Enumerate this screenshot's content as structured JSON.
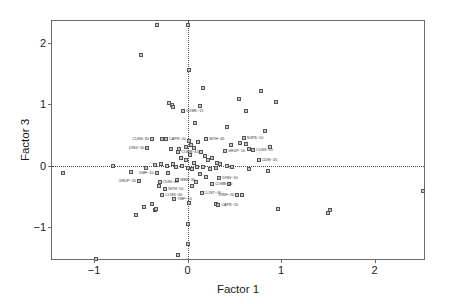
{
  "chart_data": {
    "type": "scatter",
    "title": "",
    "xlabel": "Factor 1",
    "ylabel": "Factor 3",
    "xlim": [
      -1.45,
      2.55
    ],
    "ylim": [
      -1.55,
      2.35
    ],
    "xticks": [
      -1,
      0,
      1,
      2
    ],
    "xticklabels": [
      "−1",
      "0",
      "1",
      "2"
    ],
    "yticks": [
      -1,
      0,
      1,
      2
    ],
    "yticklabels": [
      "−1",
      "0",
      "1",
      "2"
    ],
    "grid": false,
    "legend": null,
    "reference_lines": [
      {
        "axis": "x",
        "value": 0,
        "style": "dotted"
      },
      {
        "axis": "y",
        "value": 0,
        "style": "dotted"
      }
    ],
    "marker": {
      "shape": "square",
      "size": 4,
      "fill": "#c9c9c9",
      "edge": "#555555"
    },
    "points": [
      {
        "x": -0.5,
        "y": 1.8,
        "label": ""
      },
      {
        "x": 0.0,
        "y": 2.28,
        "label": ""
      },
      {
        "x": -0.33,
        "y": 2.28,
        "label": ""
      },
      {
        "x": 0.02,
        "y": 1.55,
        "label": ""
      },
      {
        "x": 0.17,
        "y": 1.26,
        "label": ""
      },
      {
        "x": -0.2,
        "y": 1.01,
        "label": ""
      },
      {
        "x": -0.17,
        "y": 0.98,
        "label": ""
      },
      {
        "x": -0.16,
        "y": 0.96,
        "label": ""
      },
      {
        "x": 0.13,
        "y": 0.97,
        "label": ""
      },
      {
        "x": -0.05,
        "y": 0.88,
        "label": "COMK~15"
      },
      {
        "x": 0.08,
        "y": 0.7,
        "label": ""
      },
      {
        "x": 0.55,
        "y": 1.08,
        "label": ""
      },
      {
        "x": 0.62,
        "y": 0.88,
        "label": ""
      },
      {
        "x": 0.42,
        "y": 0.62,
        "label": ""
      },
      {
        "x": 0.78,
        "y": 1.22,
        "label": ""
      },
      {
        "x": 0.95,
        "y": 1.03,
        "label": ""
      },
      {
        "x": -0.38,
        "y": 0.43,
        "label": "CUSS~30",
        "anchor": "left"
      },
      {
        "x": -0.27,
        "y": 0.44,
        "label": ""
      },
      {
        "x": -0.23,
        "y": 0.44,
        "label": "CAPR~20",
        "anchor": "right"
      },
      {
        "x": -0.43,
        "y": 0.29,
        "label": "DINV~30",
        "anchor": "left"
      },
      {
        "x": -0.18,
        "y": 0.27,
        "label": ""
      },
      {
        "x": -0.09,
        "y": 0.27,
        "label": ""
      },
      {
        "x": -0.1,
        "y": 0.22,
        "label": "COMB~40",
        "anchor": "right"
      },
      {
        "x": -0.02,
        "y": 0.3,
        "label": ""
      },
      {
        "x": 0.04,
        "y": 0.33,
        "label": ""
      },
      {
        "x": 0.07,
        "y": 0.29,
        "label": ""
      },
      {
        "x": 0.11,
        "y": 0.38,
        "label": ""
      },
      {
        "x": 0.02,
        "y": 0.4,
        "label": ""
      },
      {
        "x": 0.2,
        "y": 0.44,
        "label": "INTH~40",
        "anchor": "right"
      },
      {
        "x": 0.14,
        "y": 0.22,
        "label": ""
      },
      {
        "x": 0.19,
        "y": 0.16,
        "label": ""
      },
      {
        "x": 0.22,
        "y": 0.09,
        "label": ""
      },
      {
        "x": 0.26,
        "y": 0.13,
        "label": ""
      },
      {
        "x": 0.31,
        "y": 0.05,
        "label": ""
      },
      {
        "x": 0.6,
        "y": 0.45,
        "label": "SUPS~10",
        "anchor": "right"
      },
      {
        "x": 0.56,
        "y": 0.36,
        "label": ""
      },
      {
        "x": 0.63,
        "y": 0.35,
        "label": ""
      },
      {
        "x": 0.66,
        "y": 0.27,
        "label": ""
      },
      {
        "x": 0.7,
        "y": 0.26,
        "label": "CUSS~10",
        "anchor": "right"
      },
      {
        "x": 0.88,
        "y": 0.31,
        "label": ""
      },
      {
        "x": 0.4,
        "y": 0.24,
        "label": "GRUP~10",
        "anchor": "right"
      },
      {
        "x": 0.76,
        "y": 0.09,
        "label": "CDIN~20",
        "anchor": "right"
      },
      {
        "x": 0.35,
        "y": 0.02,
        "label": ""
      },
      {
        "x": 0.42,
        "y": 0.0,
        "label": ""
      },
      {
        "x": 0.48,
        "y": -0.02,
        "label": ""
      },
      {
        "x": 0.3,
        "y": -0.04,
        "label": ""
      },
      {
        "x": 0.24,
        "y": -0.06,
        "label": ""
      },
      {
        "x": 0.17,
        "y": -0.03,
        "label": ""
      },
      {
        "x": 0.1,
        "y": -0.02,
        "label": ""
      },
      {
        "x": 0.05,
        "y": -0.06,
        "label": ""
      },
      {
        "x": 0.0,
        "y": -0.04,
        "label": ""
      },
      {
        "x": -0.06,
        "y": -0.01,
        "label": ""
      },
      {
        "x": -0.12,
        "y": -0.03,
        "label": ""
      },
      {
        "x": -0.16,
        "y": 0.02,
        "label": ""
      },
      {
        "x": -0.22,
        "y": 0.0,
        "label": ""
      },
      {
        "x": -0.28,
        "y": 0.03,
        "label": ""
      },
      {
        "x": -0.35,
        "y": 0.01,
        "label": ""
      },
      {
        "x": -0.8,
        "y": 0.0,
        "label": ""
      },
      {
        "x": -1.33,
        "y": -0.12,
        "label": ""
      },
      {
        "x": -0.6,
        "y": -0.11,
        "label": ""
      },
      {
        "x": -0.33,
        "y": -0.12,
        "label": "DMF~10",
        "anchor": "left"
      },
      {
        "x": -0.21,
        "y": -0.12,
        "label": ""
      },
      {
        "x": -0.52,
        "y": -0.25,
        "label": "GRUP~20",
        "anchor": "left"
      },
      {
        "x": -0.3,
        "y": -0.26,
        "label": "CDIN~40",
        "anchor": "right"
      },
      {
        "x": -0.31,
        "y": -0.33,
        "label": ""
      },
      {
        "x": -0.11,
        "y": -0.24,
        "label": "WEB~30",
        "anchor": "right"
      },
      {
        "x": -0.24,
        "y": -0.38,
        "label": "INTH~10",
        "anchor": "right"
      },
      {
        "x": -0.27,
        "y": -0.47,
        "label": "COSK~40",
        "anchor": "right"
      },
      {
        "x": -0.14,
        "y": -0.55,
        "label": "YMF~10",
        "anchor": "right"
      },
      {
        "x": -0.38,
        "y": -0.62,
        "label": ""
      },
      {
        "x": -0.47,
        "y": -0.68,
        "label": ""
      },
      {
        "x": -0.55,
        "y": -0.8,
        "label": ""
      },
      {
        "x": -0.35,
        "y": -0.72,
        "label": ""
      },
      {
        "x": -0.34,
        "y": -0.7,
        "label": ""
      },
      {
        "x": 0.13,
        "y": -0.14,
        "label": ""
      },
      {
        "x": 0.2,
        "y": -0.18,
        "label": ""
      },
      {
        "x": 0.34,
        "y": -0.2,
        "label": "DINV~30",
        "anchor": "right"
      },
      {
        "x": 0.26,
        "y": -0.3,
        "label": "COMB~20",
        "anchor": "right"
      },
      {
        "x": 0.09,
        "y": -0.26,
        "label": ""
      },
      {
        "x": 0.05,
        "y": -0.33,
        "label": ""
      },
      {
        "x": 0.15,
        "y": -0.45,
        "label": "COST~30",
        "anchor": "right"
      },
      {
        "x": 0.44,
        "y": -0.3,
        "label": ""
      },
      {
        "x": 0.53,
        "y": -0.48,
        "label": "DINF~20",
        "anchor": "left"
      },
      {
        "x": 0.58,
        "y": -0.48,
        "label": ""
      },
      {
        "x": 0.3,
        "y": -0.62,
        "label": ""
      },
      {
        "x": 0.33,
        "y": -0.64,
        "label": "CAPR~10",
        "anchor": "right"
      },
      {
        "x": 0.02,
        "y": -0.6,
        "label": ""
      },
      {
        "x": 0.0,
        "y": -0.95,
        "label": ""
      },
      {
        "x": 0.0,
        "y": -1.28,
        "label": ""
      },
      {
        "x": -0.1,
        "y": -1.45,
        "label": ""
      },
      {
        "x": -0.98,
        "y": -1.52,
        "label": ""
      },
      {
        "x": 0.97,
        "y": -0.7,
        "label": ""
      },
      {
        "x": 1.52,
        "y": -0.72,
        "label": ""
      },
      {
        "x": 1.5,
        "y": -0.77,
        "label": ""
      },
      {
        "x": 2.52,
        "y": -0.42,
        "label": ""
      },
      {
        "x": 0.83,
        "y": 0.56,
        "label": ""
      },
      {
        "x": 0.46,
        "y": 0.33,
        "label": ""
      },
      {
        "x": -0.07,
        "y": 0.12,
        "label": ""
      },
      {
        "x": 0.03,
        "y": 0.17,
        "label": ""
      },
      {
        "x": -0.02,
        "y": 0.09,
        "label": ""
      },
      {
        "x": 0.07,
        "y": 0.05,
        "label": ""
      },
      {
        "x": -0.44,
        "y": -0.04,
        "label": ""
      },
      {
        "x": 0.66,
        "y": -0.05,
        "label": ""
      },
      {
        "x": 0.86,
        "y": -0.08,
        "label": ""
      }
    ]
  }
}
